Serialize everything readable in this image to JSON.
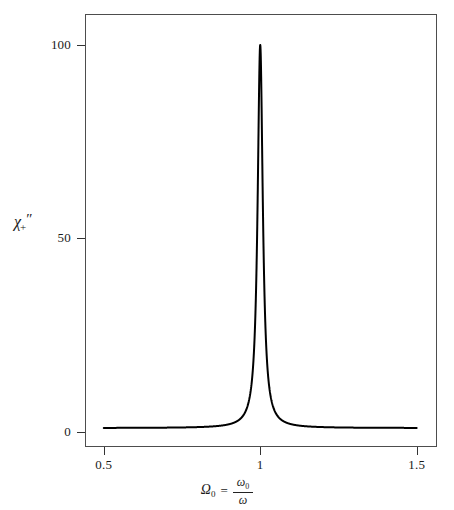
{
  "figure": {
    "background_color": "#ffffff",
    "frame_color": "#4d4d4d",
    "curve_color": "#000000"
  },
  "axes": {
    "y": {
      "label_chi": "χ",
      "label_sub": "+",
      "label_prime": "″",
      "ticks": [
        {
          "value": 0,
          "text": "0"
        },
        {
          "value": 50,
          "text": "50"
        },
        {
          "value": 100,
          "text": "100"
        }
      ],
      "min": -4,
      "max": 108
    },
    "x": {
      "label_omega": "Ω",
      "label_omega_sub": "0",
      "label_equals": "=",
      "label_num": "ω",
      "label_num_sub": "0",
      "label_den": "ω",
      "ticks": [
        {
          "value": 0.5,
          "text": "0.5"
        },
        {
          "value": 1,
          "text": "1"
        },
        {
          "value": 1.5,
          "text": "1.5"
        }
      ],
      "min": 0.44,
      "max": 1.565
    }
  },
  "chart_data": {
    "type": "line",
    "title": "",
    "subtitle": "",
    "xlabel": "Ω₀ = ω₀/ω",
    "ylabel": "χ₊″",
    "xlim": [
      0.44,
      1.565
    ],
    "ylim": [
      -4,
      108
    ],
    "xticks": [
      0.5,
      1,
      1.5
    ],
    "xticklabels": [
      "0.5",
      "1",
      "1.5"
    ],
    "yticks": [
      0,
      50,
      100
    ],
    "yticklabels": [
      "0",
      "50",
      "100"
    ],
    "grid": false,
    "legend": false,
    "legend_position": "none",
    "annotations": [],
    "model": {
      "name": "lorentzian",
      "peak_height": 100,
      "peak_center": 1.0,
      "fwhm": 0.02,
      "baseline": 0.9
    },
    "series": [
      {
        "name": "chi_plus_imag",
        "color": "#000000",
        "line_width": 2,
        "x": [
          0.5,
          0.52,
          0.54,
          0.56,
          0.58,
          0.6,
          0.62,
          0.64,
          0.66,
          0.68,
          0.7,
          0.72,
          0.74,
          0.76,
          0.78,
          0.8,
          0.82,
          0.84,
          0.86,
          0.88,
          0.9,
          0.91,
          0.92,
          0.93,
          0.94,
          0.95,
          0.955,
          0.96,
          0.965,
          0.97,
          0.973,
          0.976,
          0.979,
          0.982,
          0.984,
          0.986,
          0.988,
          0.99,
          0.991,
          0.992,
          0.993,
          0.994,
          0.995,
          0.996,
          0.997,
          0.998,
          0.999,
          1.0,
          1.001,
          1.002,
          1.003,
          1.004,
          1.005,
          1.006,
          1.007,
          1.008,
          1.009,
          1.01,
          1.012,
          1.014,
          1.016,
          1.018,
          1.021,
          1.024,
          1.027,
          1.03,
          1.035,
          1.04,
          1.045,
          1.05,
          1.06,
          1.07,
          1.08,
          1.09,
          1.1,
          1.12,
          1.14,
          1.16,
          1.18,
          1.2,
          1.25,
          1.3,
          1.35,
          1.4,
          1.45,
          1.5
        ],
        "y": [
          0.91,
          0.91,
          0.91,
          0.91,
          0.91,
          0.92,
          0.92,
          0.92,
          0.92,
          0.93,
          0.93,
          0.93,
          0.94,
          0.94,
          0.95,
          0.96,
          0.97,
          0.98,
          0.99,
          1.01,
          1.04,
          1.06,
          1.09,
          1.13,
          1.18,
          1.26,
          1.31,
          1.38,
          1.46,
          1.58,
          1.68,
          1.81,
          1.99,
          2.24,
          2.47,
          2.78,
          3.22,
          3.85,
          4.28,
          4.82,
          5.52,
          6.45,
          7.72,
          9.56,
          12.36,
          16.93,
          25.0,
          40.12,
          25.0,
          16.93,
          12.36,
          9.56,
          7.72,
          6.45,
          5.52,
          4.82,
          4.28,
          3.85,
          3.22,
          2.78,
          2.47,
          2.24,
          1.99,
          1.81,
          1.68,
          1.58,
          1.46,
          1.38,
          1.31,
          1.26,
          1.18,
          1.13,
          1.09,
          1.06,
          1.04,
          1.01,
          0.99,
          0.98,
          0.97,
          0.96,
          0.95,
          0.94,
          0.93,
          0.93,
          0.92,
          0.92
        ]
      }
    ]
  }
}
